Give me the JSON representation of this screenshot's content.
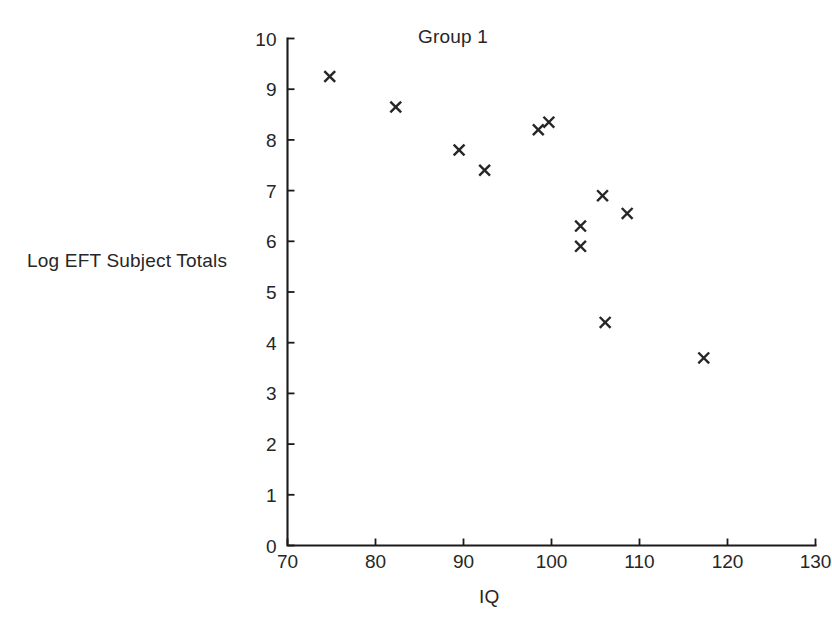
{
  "chart_data": {
    "type": "scatter",
    "title": "Group 1",
    "xlabel": "IQ",
    "ylabel": "Log EFT Subject Totals",
    "xlim": [
      70,
      130
    ],
    "ylim": [
      0,
      10
    ],
    "xticks": [
      70,
      80,
      90,
      100,
      110,
      120,
      130
    ],
    "xtick_labels": [
      "70",
      "80",
      "90",
      "100",
      "110",
      "120",
      "130"
    ],
    "yticks": [
      0,
      1,
      2,
      3,
      4,
      5,
      6,
      7,
      8,
      9,
      10
    ],
    "ytick_labels": [
      "0",
      "1",
      "2",
      "3",
      "4",
      "5",
      "6",
      "7",
      "8",
      "9",
      "10"
    ],
    "grid": false,
    "legend": "none",
    "marker": "x",
    "marker_color": "#262626",
    "series": [
      {
        "name": "Group 1",
        "points": [
          {
            "x": 74.8,
            "y": 9.25
          },
          {
            "x": 82.3,
            "y": 8.65
          },
          {
            "x": 89.5,
            "y": 7.8
          },
          {
            "x": 92.4,
            "y": 7.4
          },
          {
            "x": 98.5,
            "y": 8.2
          },
          {
            "x": 99.7,
            "y": 8.35
          },
          {
            "x": 103.3,
            "y": 6.3
          },
          {
            "x": 103.3,
            "y": 5.9
          },
          {
            "x": 105.8,
            "y": 6.9
          },
          {
            "x": 108.6,
            "y": 6.55
          },
          {
            "x": 106.1,
            "y": 4.4
          },
          {
            "x": 117.3,
            "y": 3.7
          }
        ]
      }
    ]
  },
  "figure": {
    "background": "#ffffff",
    "axis_color": "#1a1a1a",
    "text_color": "#262626"
  }
}
